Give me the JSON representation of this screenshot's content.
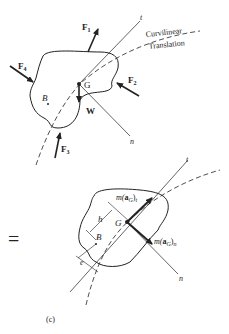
{
  "diagram": {
    "top": {
      "forces": {
        "F1": "F",
        "F1_sub": "1",
        "F2": "F",
        "F2_sub": "2",
        "F3": "F",
        "F3_sub": "3",
        "F4": "F",
        "F4_sub": "4"
      },
      "weight": "W",
      "center_label": "G",
      "point_label": "B",
      "axis_t": "t",
      "axis_n": "n",
      "path_label_1": "Curvilinear",
      "path_label_2": "Translation"
    },
    "equals_sign": "=",
    "bottom": {
      "tangential_inertia": "m(aG)t",
      "tangential_m": "m(",
      "tangential_a": "a",
      "tangential_sub": "G",
      "tangential_close": ")",
      "tangential_dir": "t",
      "normal_m": "m(",
      "normal_a": "a",
      "normal_sub": "G",
      "normal_close": ")",
      "normal_dir": "n",
      "center_label": "G",
      "point_label": "B",
      "dim_h": "h",
      "dim_e": "e",
      "axis_t": "t",
      "axis_n": "n"
    },
    "caption": "(c)"
  },
  "colors": {
    "ink": "#222222",
    "background": "#ffffff"
  }
}
